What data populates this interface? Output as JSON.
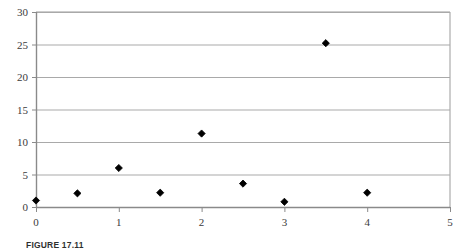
{
  "chart_data": {
    "type": "scatter",
    "title": "",
    "xlabel": "",
    "ylabel": "",
    "xlim": [
      0,
      5
    ],
    "ylim": [
      0,
      30
    ],
    "grid": true,
    "grid_axis": "y",
    "legend": false,
    "marker": "diamond",
    "marker_color": "#000000",
    "xticks": [
      "0",
      "1",
      "2",
      "3",
      "4",
      "5"
    ],
    "xtick_values": [
      0,
      1,
      2,
      3,
      4,
      5
    ],
    "yticks": [
      "0",
      "5",
      "10",
      "15",
      "20",
      "25",
      "30"
    ],
    "ytick_values": [
      0,
      5,
      10,
      15,
      20,
      25,
      30
    ],
    "series": [
      {
        "name": "",
        "points": [
          {
            "x": 0.0,
            "y": 1.0
          },
          {
            "x": 0.5,
            "y": 2.1
          },
          {
            "x": 1.0,
            "y": 6.0
          },
          {
            "x": 1.5,
            "y": 2.2
          },
          {
            "x": 2.0,
            "y": 11.3
          },
          {
            "x": 2.5,
            "y": 3.6
          },
          {
            "x": 3.0,
            "y": 0.8
          },
          {
            "x": 3.5,
            "y": 25.2
          },
          {
            "x": 4.0,
            "y": 2.2
          }
        ]
      }
    ]
  },
  "caption": {
    "label": "FIGURE 17.11",
    "text": ""
  },
  "colors": {
    "grid": "#a9a9a9",
    "axis": "#8a8a8a",
    "marker": "#000000",
    "tick_text": "#3b3b3b",
    "border": "#9b9b9b"
  }
}
